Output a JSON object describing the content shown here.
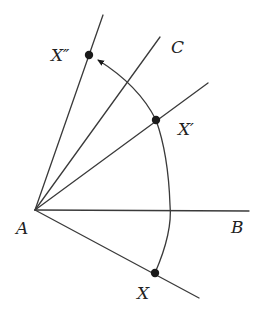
{
  "diagram": {
    "colors": {
      "line": "#3a3a3a",
      "point": "#1a1a1a",
      "background": "#ffffff"
    },
    "labels": {
      "A": "A",
      "B": "B",
      "C": "C",
      "X": "X",
      "X_prime": "X′",
      "X_double_prime": "X″"
    },
    "vertex": {
      "name": "A",
      "x": 35,
      "y": 210
    },
    "rays": [
      {
        "name": "ray-AX",
        "to": [
          199,
          298
        ]
      },
      {
        "name": "ray-AB",
        "to": [
          249,
          211
        ]
      },
      {
        "name": "ray-AX-prime",
        "to": [
          208,
          83
        ]
      },
      {
        "name": "ray-AC",
        "to": [
          160,
          37
        ]
      },
      {
        "name": "ray-AX-double-prime",
        "to": [
          103,
          15
        ]
      }
    ],
    "points": [
      {
        "name": "X",
        "x": 155,
        "y": 273
      },
      {
        "name": "X'",
        "x": 156,
        "y": 120
      },
      {
        "name": "X''",
        "x": 89,
        "y": 55
      }
    ],
    "arc": {
      "from": "X",
      "through": "X'",
      "to": "X''",
      "arrowhead_at": "X''"
    }
  }
}
